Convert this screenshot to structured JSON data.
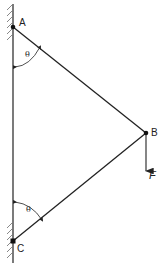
{
  "diagram": {
    "type": "truss-statics",
    "points": {
      "A": {
        "label": "A",
        "x": 13,
        "y": 27
      },
      "B": {
        "label": "B",
        "x": 146,
        "y": 133
      },
      "C": {
        "label": "C",
        "x": 13,
        "y": 241
      }
    },
    "members": [
      {
        "from": "A",
        "to": "B"
      },
      {
        "from": "B",
        "to": "C"
      }
    ],
    "angles": [
      {
        "label": "θ",
        "at": "A",
        "between": [
          "wall",
          "AB"
        ]
      },
      {
        "label": "θ",
        "at": "C",
        "between": [
          "wall",
          "CB"
        ]
      }
    ],
    "load": {
      "label": "F",
      "at": "B",
      "direction": "down"
    },
    "support": {
      "type": "wall",
      "side": "left"
    },
    "colors": {
      "line": "#222222",
      "background": "#ffffff"
    }
  }
}
